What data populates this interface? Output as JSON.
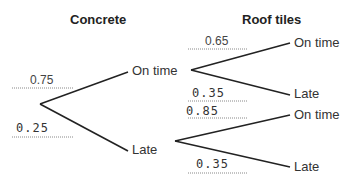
{
  "diagram": {
    "type": "probability-tree",
    "stages": [
      {
        "title": "Concrete"
      },
      {
        "title": "Roof tiles"
      }
    ],
    "concrete": {
      "branches": [
        {
          "outcome": "On time",
          "probability": "0.75",
          "filled_by": "printed"
        },
        {
          "outcome": "Late",
          "probability": "0.25",
          "filled_by": "handwritten"
        }
      ]
    },
    "roof_tiles_after_on_time": {
      "branches": [
        {
          "outcome": "On time",
          "probability": "0.65",
          "filled_by": "printed"
        },
        {
          "outcome": "Late",
          "probability": "0.35",
          "filled_by": "handwritten"
        }
      ]
    },
    "roof_tiles_after_late": {
      "branches": [
        {
          "outcome": "On time",
          "probability": "0.85",
          "filled_by": "handwritten"
        },
        {
          "outcome": "Late",
          "probability": "0.35",
          "filled_by": "handwritten"
        }
      ]
    }
  }
}
